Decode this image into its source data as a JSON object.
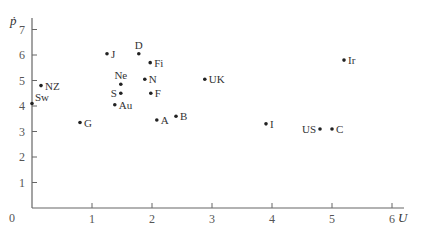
{
  "chart_data": {
    "type": "scatter",
    "title": "",
    "xlabel": "U",
    "ylabel": "ṗ",
    "xlim": [
      0,
      6
    ],
    "ylim": [
      0,
      7
    ],
    "xticks": [
      1,
      2,
      3,
      4,
      5,
      6
    ],
    "yticks": [
      1,
      2,
      3,
      4,
      5,
      6,
      7
    ],
    "origin_label": "0",
    "grid": false,
    "legend": null,
    "points": [
      {
        "label": "Sw",
        "x": 0.0,
        "y": 4.1,
        "label_pos": "upper-right"
      },
      {
        "label": "NZ",
        "x": 0.15,
        "y": 4.8,
        "label_pos": "right"
      },
      {
        "label": "G",
        "x": 0.8,
        "y": 3.35,
        "label_pos": "right"
      },
      {
        "label": "J",
        "x": 1.25,
        "y": 6.05,
        "label_pos": "right"
      },
      {
        "label": "Ne",
        "x": 1.48,
        "y": 4.85,
        "label_pos": "above"
      },
      {
        "label": "S",
        "x": 1.48,
        "y": 4.5,
        "label_pos": "left"
      },
      {
        "label": "Au",
        "x": 1.38,
        "y": 4.05,
        "label_pos": "right"
      },
      {
        "label": "D",
        "x": 1.78,
        "y": 6.05,
        "label_pos": "above"
      },
      {
        "label": "Fi",
        "x": 1.97,
        "y": 5.7,
        "label_pos": "right"
      },
      {
        "label": "N",
        "x": 1.88,
        "y": 5.05,
        "label_pos": "right"
      },
      {
        "label": "F",
        "x": 1.98,
        "y": 4.5,
        "label_pos": "right"
      },
      {
        "label": "A",
        "x": 2.08,
        "y": 3.45,
        "label_pos": "right"
      },
      {
        "label": "B",
        "x": 2.4,
        "y": 3.6,
        "label_pos": "right"
      },
      {
        "label": "UK",
        "x": 2.88,
        "y": 5.05,
        "label_pos": "right"
      },
      {
        "label": "I",
        "x": 3.9,
        "y": 3.3,
        "label_pos": "right"
      },
      {
        "label": "US",
        "x": 4.8,
        "y": 3.1,
        "label_pos": "left"
      },
      {
        "label": "C",
        "x": 5.0,
        "y": 3.1,
        "label_pos": "right"
      },
      {
        "label": "Ir",
        "x": 5.2,
        "y": 5.8,
        "label_pos": "right"
      }
    ]
  },
  "style": {
    "axis_color": "#666666",
    "point_color": "#222222",
    "text_color": "#333333"
  }
}
